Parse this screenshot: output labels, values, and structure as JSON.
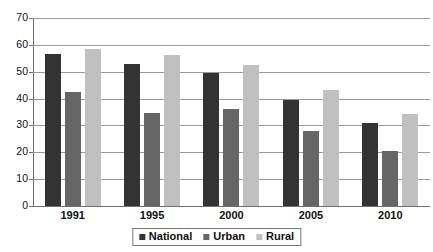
{
  "chart_data": {
    "type": "bar",
    "title": "",
    "subtitle": "",
    "xlabel": "",
    "ylabel": "",
    "categories": [
      "1991",
      "1995",
      "2000",
      "2005",
      "2010"
    ],
    "series": [
      {
        "name": "National",
        "color": "#333333",
        "values": [
          56.6,
          53.0,
          49.6,
          39.4,
          30.9
        ]
      },
      {
        "name": "Urban",
        "color": "#666666",
        "values": [
          42.4,
          34.8,
          36.2,
          28.0,
          20.5
        ]
      },
      {
        "name": "Rural",
        "color": "#c0c0c0",
        "values": [
          58.5,
          56.4,
          52.6,
          43.1,
          34.3
        ]
      }
    ],
    "ylim": [
      0,
      70
    ],
    "ytick_labels": [
      "70",
      "60",
      "50",
      "40",
      "30",
      "20",
      "10",
      "0"
    ],
    "ytick_values": [
      70,
      60,
      50,
      40,
      30,
      20,
      10,
      0
    ],
    "grid": true,
    "legend_position": "bottom",
    "annotations": []
  }
}
